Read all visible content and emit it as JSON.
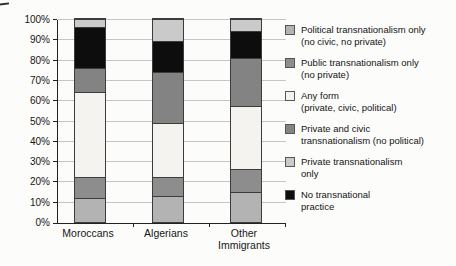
{
  "figure": {
    "background": "#fcfcfb"
  },
  "chart_data": {
    "type": "bar",
    "stacked": true,
    "title": "",
    "xlabel": "",
    "ylabel": "",
    "categories": [
      "Moroccans",
      "Algerians",
      "Other Immigrants"
    ],
    "series": [
      {
        "name": "Political transnationalism only (no civic, no private)",
        "color": "#b3b3b3",
        "values": [
          12,
          13,
          15
        ]
      },
      {
        "name": "Public transnationalism only (no private)",
        "color": "#8d8d8d",
        "values": [
          10,
          9,
          11
        ]
      },
      {
        "name": "Any form (private, civic, political)",
        "color": "#f4f3ef",
        "values": [
          42,
          27,
          31
        ]
      },
      {
        "name": "Private and civic transnationalism (no political)",
        "color": "#838383",
        "values": [
          12,
          25,
          24
        ]
      },
      {
        "name": "No transnational practice",
        "color": "#0d0d0d",
        "values": [
          20,
          15,
          13
        ]
      },
      {
        "name": "Private transnationalism only",
        "color": "#cacaca",
        "values": [
          4,
          11,
          6
        ]
      }
    ],
    "stack_order_note": "series listed bottom-to-top of each bar",
    "ylim": [
      0,
      100
    ],
    "y_ticks": [
      "0%",
      "10%",
      "20%",
      "30%",
      "40%",
      "50%",
      "60%",
      "70%",
      "80%",
      "90%",
      "100%"
    ],
    "grid": true,
    "legend_position": "right"
  },
  "legend": {
    "items": [
      {
        "label": "Political transnationalism only\n(no civic, no private)",
        "color": "#b3b3b3"
      },
      {
        "label": "Public transnationalism only\n(no private)",
        "color": "#8d8d8d"
      },
      {
        "label": "Any form\n(private, civic, political)",
        "color": "#f4f3ef"
      },
      {
        "label": "Private and civic\ntransnationalism (no political)",
        "color": "#838383"
      },
      {
        "label": "Private transnationalism\nonly",
        "color": "#cacaca"
      },
      {
        "label": "No transnational\npractice",
        "color": "#0d0d0d"
      }
    ]
  }
}
